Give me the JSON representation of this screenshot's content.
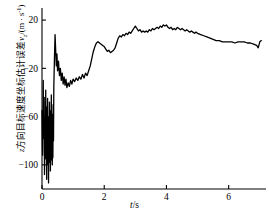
{
  "chart_data": {
    "type": "line",
    "title": "",
    "xlabel": "t/s",
    "ylabel": "z方向目标速度坐标估计误差vz/(m·s-1)",
    "ylabel_parts": {
      "prefix_var": "z",
      "cjk_text": "方向目标速度坐标估计误差",
      "symbol": "v",
      "symbol_sub": "z",
      "unit": "/(m · s",
      "unit_exp": "-1",
      "unit_close": ")"
    },
    "xlim": [
      0,
      7.2
    ],
    "ylim": [
      -120,
      30
    ],
    "xticks": [
      0,
      2,
      4,
      6
    ],
    "xtick_labels": [
      "0",
      "2",
      "4",
      "6"
    ],
    "yticks": [
      20,
      -20,
      -60,
      -100
    ],
    "ytick_labels": [
      "20",
      "-20",
      "-60",
      "-100"
    ],
    "grid": false,
    "legend": null,
    "line_color": "#000000",
    "line_width": 1.3,
    "axis_color": "#000000",
    "series": [
      {
        "name": "z-velocity estimation error",
        "x": [
          0.0,
          0.02,
          0.04,
          0.05,
          0.07,
          0.08,
          0.1,
          0.11,
          0.12,
          0.13,
          0.14,
          0.15,
          0.16,
          0.17,
          0.18,
          0.19,
          0.2,
          0.21,
          0.22,
          0.23,
          0.24,
          0.25,
          0.26,
          0.27,
          0.28,
          0.29,
          0.3,
          0.31,
          0.32,
          0.33,
          0.34,
          0.35,
          0.36,
          0.37,
          0.38,
          0.4,
          0.42,
          0.44,
          0.46,
          0.48,
          0.5,
          0.53,
          0.56,
          0.59,
          0.62,
          0.65,
          0.68,
          0.71,
          0.74,
          0.77,
          0.8,
          0.84,
          0.88,
          0.92,
          0.96,
          1.0,
          1.05,
          1.1,
          1.15,
          1.2,
          1.25,
          1.3,
          1.35,
          1.4,
          1.45,
          1.5,
          1.55,
          1.6,
          1.65,
          1.7,
          1.75,
          1.8,
          1.85,
          1.9,
          1.95,
          2.0,
          2.05,
          2.1,
          2.15,
          2.2,
          2.25,
          2.3,
          2.35,
          2.4,
          2.45,
          2.5,
          2.55,
          2.6,
          2.65,
          2.7,
          2.75,
          2.8,
          2.85,
          2.9,
          2.95,
          3.0,
          3.05,
          3.1,
          3.15,
          3.2,
          3.25,
          3.3,
          3.35,
          3.4,
          3.45,
          3.5,
          3.55,
          3.6,
          3.65,
          3.7,
          3.75,
          3.8,
          3.85,
          3.9,
          3.95,
          4.0,
          4.05,
          4.1,
          4.15,
          4.2,
          4.25,
          4.3,
          4.35,
          4.4,
          4.45,
          4.5,
          4.55,
          4.6,
          4.65,
          4.7,
          4.75,
          4.8,
          4.85,
          4.9,
          4.95,
          5.0,
          5.1,
          5.2,
          5.3,
          5.4,
          5.5,
          5.6,
          5.7,
          5.8,
          5.9,
          6.0,
          6.1,
          6.2,
          6.3,
          6.4,
          6.5,
          6.6,
          6.7,
          6.8,
          6.9,
          6.95,
          7.0,
          7.05
        ],
        "y": [
          -55,
          -92,
          -30,
          -78,
          -44,
          -108,
          -62,
          -95,
          -38,
          -86,
          -52,
          -112,
          -70,
          -100,
          -45,
          -88,
          -60,
          -115,
          -75,
          -98,
          -48,
          -90,
          -55,
          -105,
          -68,
          -96,
          -42,
          -85,
          -58,
          -100,
          -72,
          -94,
          -50,
          -80,
          -35,
          -12,
          8,
          -5,
          -18,
          -8,
          -22,
          -14,
          -26,
          -20,
          -30,
          -24,
          -33,
          -27,
          -34,
          -29,
          -36,
          -32,
          -35,
          -30,
          -33,
          -29,
          -31,
          -28,
          -30,
          -27,
          -29,
          -25,
          -28,
          -24,
          -26,
          -22,
          -18,
          -12,
          -6,
          -2,
          1,
          2,
          1,
          0,
          -1,
          -2,
          -4,
          -6,
          -5,
          -7,
          -6,
          -5,
          -3,
          1,
          5,
          7,
          6,
          8,
          7,
          9,
          8,
          10,
          9,
          11,
          13,
          15,
          13,
          11,
          12,
          10,
          11,
          10,
          11,
          10,
          12,
          11,
          13,
          12,
          13,
          14,
          13,
          15,
          14,
          16,
          15,
          16,
          14,
          13,
          14,
          12,
          13,
          12,
          14,
          13,
          12,
          13,
          12,
          11,
          12,
          11,
          10,
          11,
          10,
          9,
          10,
          9,
          8,
          7,
          6,
          5,
          4,
          3,
          3,
          2,
          2,
          2,
          2,
          1,
          2,
          2,
          2,
          1,
          1,
          0,
          -1,
          -3,
          2,
          3
        ]
      }
    ]
  },
  "axes": {
    "x_axis_name": "time-axis",
    "y_axis_name": "velocity-error-axis"
  }
}
